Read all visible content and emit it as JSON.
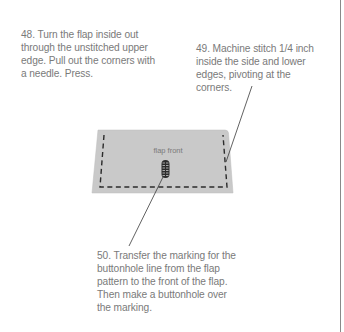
{
  "steps": [
    {
      "number": "48",
      "text": "48. Turn the flap inside out through the unstitched upper edge. Pull out the corners with a needle. Press."
    },
    {
      "number": "49",
      "text": "49. Machine stitch 1/4 inch inside the side and lower edges, pivoting at the corners."
    },
    {
      "number": "50",
      "text": "50. Transfer the marking for the buttonhole line from the flap pattern to the front of the flap. Then make a buttonhole over the marking."
    }
  ],
  "diagram": {
    "flap_label": "flap front",
    "colors": {
      "flap_fill": "#c9c9c9",
      "stitch_line": "#2b2b2b",
      "leader_line": "#3a3a3a",
      "text": "#7a7a7a"
    }
  }
}
